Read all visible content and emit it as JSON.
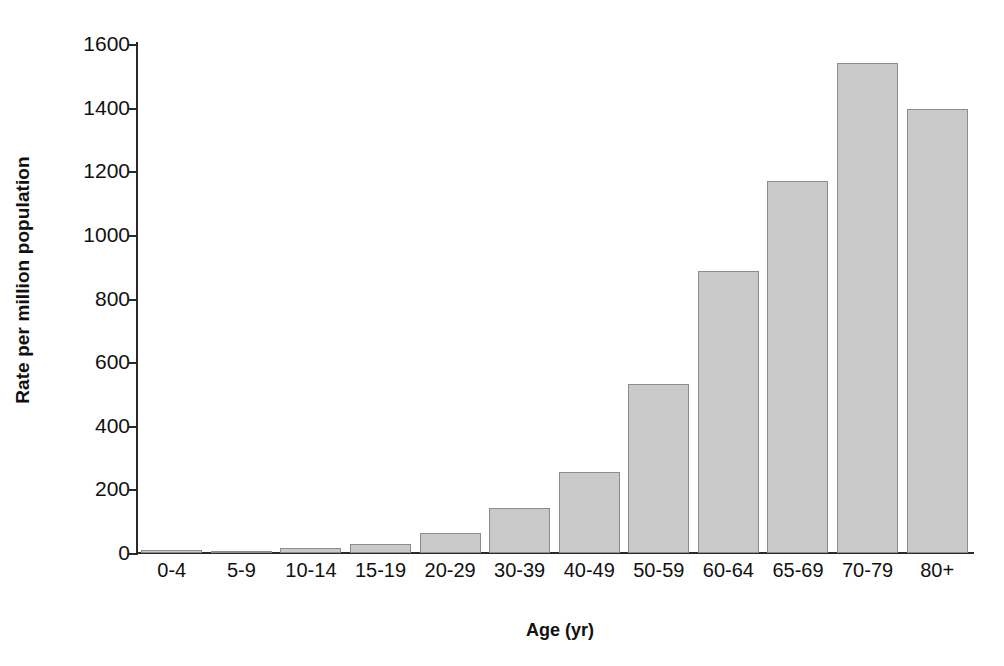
{
  "chart_data": {
    "type": "bar",
    "title": "",
    "subtitle": "",
    "xlabel": "Age (yr)",
    "ylabel": "Rate per million population",
    "categories": [
      "0-4",
      "5-9",
      "10-14",
      "15-19",
      "20-29",
      "30-39",
      "40-49",
      "50-59",
      "60-64",
      "65-69",
      "70-79",
      "80+"
    ],
    "values": [
      8,
      4,
      15,
      28,
      62,
      140,
      255,
      530,
      885,
      1170,
      1540,
      1395
    ],
    "ylim": [
      0,
      1600
    ],
    "yticks": [
      0,
      200,
      400,
      600,
      800,
      1000,
      1200,
      1400,
      1600
    ],
    "ytick_labels": [
      "0",
      "200",
      "400",
      "600",
      "800",
      "1000",
      "1200",
      "1400",
      "1600"
    ],
    "grid": false,
    "legend": null,
    "series": [
      {
        "name": "Rate per million population",
        "values": [
          8,
          4,
          15,
          28,
          62,
          140,
          255,
          530,
          885,
          1170,
          1540,
          1395
        ],
        "color": "#c9c9c9",
        "edge_color": "#8c8c8c"
      }
    ],
    "colors": {
      "bar_fill": "#c9c9c9",
      "bar_edge": "#8c8c8c",
      "axis": "#2a2a2a",
      "text": "#111111",
      "background": "#ffffff"
    }
  }
}
